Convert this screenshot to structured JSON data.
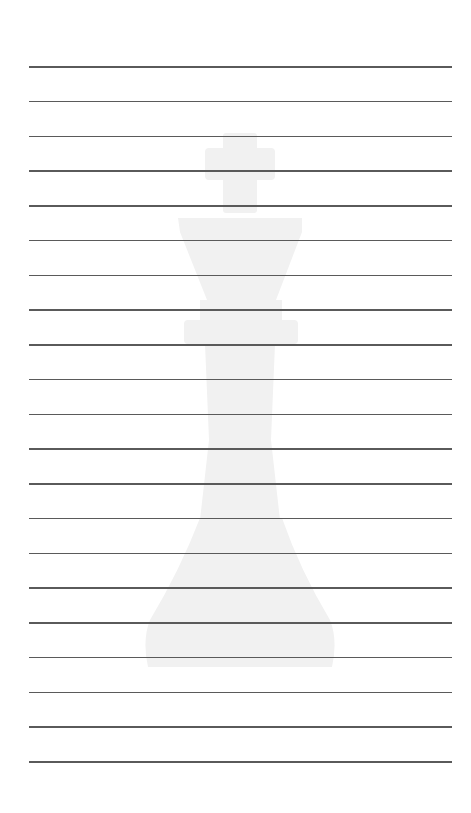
{
  "page": {
    "type": "lined-paper",
    "background_color": "#ffffff",
    "line_color": "#5a5a5a",
    "watermark_color": "#f1f1f1",
    "line_count": 21,
    "first_line_y": 66,
    "line_spacing": 34.75,
    "line_left": 29,
    "line_right": 452
  },
  "watermark": {
    "icon": "chess-king-icon",
    "description": "faint chess king silhouette"
  }
}
